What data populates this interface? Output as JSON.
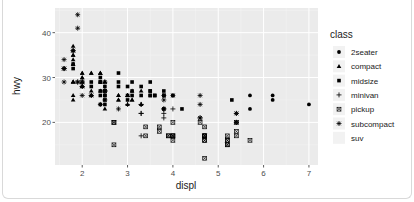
{
  "chart_data": {
    "type": "scatter",
    "title": "",
    "xlabel": "displ",
    "ylabel": "hwy",
    "xlim": [
      1.4,
      7.2
    ],
    "ylim": [
      10.5,
      45.5
    ],
    "x_ticks": [
      2,
      3,
      4,
      5,
      6,
      7
    ],
    "x_tick_labels": [
      "2",
      "3",
      "4",
      "5",
      "6",
      "7"
    ],
    "y_ticks": [
      20,
      30,
      40
    ],
    "y_tick_labels": [
      "20",
      "30",
      "40"
    ],
    "grid": true,
    "legend": {
      "title": "class",
      "placement": "right",
      "entries": [
        {
          "label": "2seater",
          "shape": "circle"
        },
        {
          "label": "compact",
          "shape": "triangle"
        },
        {
          "label": "midsize",
          "shape": "square"
        },
        {
          "label": "minivan",
          "shape": "plus"
        },
        {
          "label": "pickup",
          "shape": "square-cross"
        },
        {
          "label": "subcompact",
          "shape": "star"
        },
        {
          "label": "suv",
          "shape": "none"
        }
      ]
    },
    "series": [
      {
        "name": "2seater",
        "shape": "circle",
        "points": [
          [
            5.7,
            26
          ],
          [
            5.7,
            23
          ],
          [
            6.2,
            26
          ],
          [
            6.2,
            25
          ],
          [
            7.0,
            24
          ]
        ]
      },
      {
        "name": "compact",
        "shape": "triangle",
        "points": [
          [
            1.8,
            29
          ],
          [
            1.8,
            29
          ],
          [
            2.0,
            31
          ],
          [
            2.0,
            30
          ],
          [
            2.8,
            26
          ],
          [
            2.8,
            26
          ],
          [
            3.1,
            27
          ],
          [
            1.8,
            26
          ],
          [
            1.8,
            25
          ],
          [
            2.0,
            28
          ],
          [
            2.0,
            29
          ],
          [
            2.8,
            25
          ],
          [
            2.8,
            25
          ],
          [
            3.1,
            25
          ],
          [
            3.1,
            25
          ],
          [
            2.2,
            26
          ],
          [
            2.2,
            27
          ],
          [
            2.4,
            31
          ],
          [
            2.4,
            31
          ],
          [
            3.0,
            26
          ],
          [
            3.0,
            26
          ],
          [
            3.3,
            27
          ],
          [
            1.8,
            36
          ],
          [
            1.8,
            35
          ],
          [
            1.8,
            37
          ],
          [
            1.8,
            35
          ],
          [
            1.8,
            33
          ],
          [
            1.8,
            34
          ],
          [
            1.8,
            29
          ],
          [
            1.8,
            33
          ],
          [
            2.0,
            31
          ],
          [
            2.0,
            30
          ],
          [
            2.0,
            29
          ],
          [
            2.0,
            28
          ],
          [
            2.5,
            29
          ],
          [
            2.5,
            29
          ],
          [
            2.2,
            31
          ],
          [
            2.2,
            31
          ],
          [
            2.4,
            27
          ],
          [
            2.4,
            29
          ],
          [
            3.0,
            26
          ],
          [
            3.0,
            24
          ],
          [
            3.3,
            24
          ],
          [
            2.4,
            31
          ],
          [
            2.5,
            23
          ]
        ]
      },
      {
        "name": "midsize",
        "shape": "square",
        "points": [
          [
            2.8,
            28
          ],
          [
            3.1,
            27
          ],
          [
            4.2,
            23
          ],
          [
            2.4,
            27
          ],
          [
            2.4,
            30
          ],
          [
            3.1,
            26
          ],
          [
            3.5,
            29
          ],
          [
            3.6,
            26
          ],
          [
            2.4,
            29
          ],
          [
            2.4,
            29
          ],
          [
            2.5,
            25
          ],
          [
            2.5,
            24
          ],
          [
            3.3,
            26
          ],
          [
            3.3,
            28
          ],
          [
            3.5,
            26
          ],
          [
            3.8,
            26
          ],
          [
            3.8,
            27
          ],
          [
            4.0,
            26
          ],
          [
            3.1,
            29
          ],
          [
            3.8,
            26
          ],
          [
            3.8,
            23
          ],
          [
            5.3,
            25
          ],
          [
            2.5,
            26
          ],
          [
            2.5,
            28
          ],
          [
            2.5,
            26
          ],
          [
            2.5,
            27
          ],
          [
            3.0,
            28
          ],
          [
            3.0,
            26
          ],
          [
            3.5,
            26
          ],
          [
            3.5,
            27
          ],
          [
            2.2,
            28
          ],
          [
            2.2,
            29
          ],
          [
            2.4,
            24
          ],
          [
            2.4,
            26
          ],
          [
            3.0,
            25
          ],
          [
            3.5,
            27
          ],
          [
            2.8,
            29
          ],
          [
            2.8,
            31
          ],
          [
            3.6,
            26
          ],
          [
            1.8,
            32
          ],
          [
            1.8,
            33
          ]
        ]
      },
      {
        "name": "minivan",
        "shape": "plus",
        "points": [
          [
            2.4,
            24
          ],
          [
            3.0,
            24
          ],
          [
            3.3,
            22
          ],
          [
            3.3,
            22
          ],
          [
            3.3,
            24
          ],
          [
            3.3,
            24
          ],
          [
            3.3,
            17
          ],
          [
            3.8,
            22
          ],
          [
            3.8,
            21
          ],
          [
            3.8,
            23
          ],
          [
            4.0,
            23
          ]
        ]
      },
      {
        "name": "pickup",
        "shape": "square-cross",
        "points": [
          [
            2.7,
            20
          ],
          [
            2.7,
            15
          ],
          [
            2.7,
            20
          ],
          [
            3.4,
            17
          ],
          [
            3.4,
            19
          ],
          [
            4.0,
            17
          ],
          [
            4.7,
            17
          ],
          [
            4.7,
            16
          ],
          [
            4.7,
            19
          ],
          [
            5.2,
            17
          ],
          [
            5.7,
            16
          ],
          [
            4.7,
            12
          ],
          [
            4.7,
            16
          ],
          [
            4.7,
            17
          ],
          [
            5.2,
            15
          ],
          [
            5.2,
            16
          ],
          [
            3.9,
            17
          ],
          [
            3.9,
            17
          ],
          [
            4.7,
            17
          ],
          [
            4.7,
            17
          ],
          [
            5.2,
            15
          ],
          [
            5.2,
            16
          ],
          [
            4.0,
            20
          ],
          [
            4.0,
            17
          ],
          [
            4.6,
            20
          ],
          [
            5.4,
            17
          ],
          [
            5.4,
            18
          ],
          [
            4.0,
            16
          ],
          [
            5.4,
            20
          ],
          [
            3.7,
            19
          ],
          [
            3.7,
            18
          ],
          [
            4.0,
            17
          ]
        ]
      },
      {
        "name": "subcompact",
        "shape": "star",
        "points": [
          [
            3.8,
            26
          ],
          [
            3.8,
            25
          ],
          [
            4.0,
            26
          ],
          [
            4.6,
            24
          ],
          [
            4.6,
            21
          ],
          [
            5.4,
            22
          ],
          [
            5.4,
            20
          ],
          [
            3.8,
            23
          ],
          [
            1.6,
            32
          ],
          [
            1.6,
            32
          ],
          [
            1.6,
            29
          ],
          [
            1.6,
            32
          ],
          [
            1.6,
            34
          ],
          [
            1.8,
            36
          ],
          [
            1.8,
            36
          ],
          [
            2.0,
            29
          ],
          [
            1.9,
            44
          ],
          [
            1.9,
            41
          ],
          [
            1.9,
            29
          ],
          [
            2.0,
            26
          ],
          [
            2.0,
            28
          ],
          [
            2.5,
            27
          ],
          [
            2.5,
            25
          ],
          [
            2.5,
            27
          ],
          [
            2.2,
            26
          ],
          [
            2.2,
            26
          ],
          [
            2.5,
            29
          ],
          [
            2.5,
            27
          ],
          [
            2.8,
            23
          ],
          [
            2.0,
            29
          ],
          [
            1.9,
            29
          ],
          [
            2.0,
            28
          ],
          [
            4.6,
            21
          ],
          [
            4.6,
            26
          ],
          [
            5.4,
            20
          ],
          [
            5.4,
            22
          ]
        ]
      }
    ]
  }
}
